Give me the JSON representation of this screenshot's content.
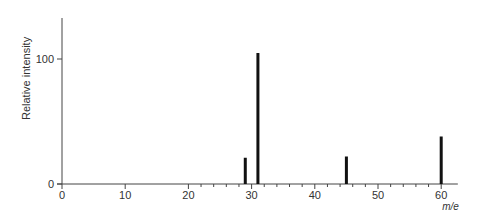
{
  "chart_data": {
    "type": "bar",
    "title": "",
    "xlabel": "m/e",
    "ylabel": "Relative intensity",
    "x": [
      29,
      31,
      45,
      60
    ],
    "values": [
      21,
      100,
      22,
      38
    ],
    "xlim": [
      0,
      62
    ],
    "ylim": [
      0,
      100
    ],
    "x_ticks": [
      0,
      10,
      20,
      30,
      40,
      50,
      60
    ],
    "x_minor_ticks_from": 20,
    "x_minor_step": 2,
    "y_ticks": [
      0,
      100
    ],
    "grid": false,
    "legend": null,
    "bar_color": "#111111",
    "axis_color": "#444444"
  }
}
